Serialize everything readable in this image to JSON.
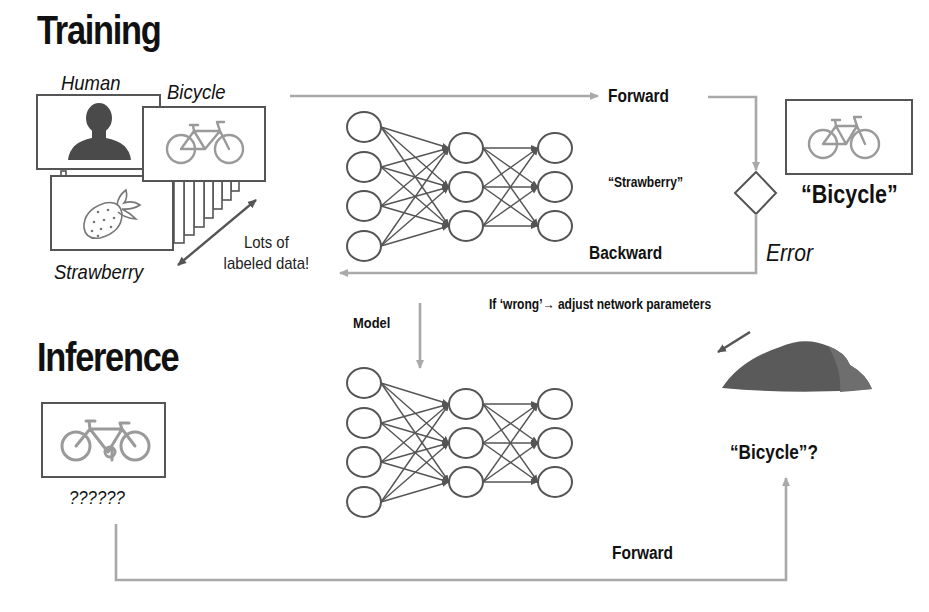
{
  "sections": {
    "training_title": "Training",
    "inference_title": "Inference"
  },
  "training": {
    "image_labels": {
      "human": "Human",
      "bicycle": "Bicycle",
      "strawberry": "Strawberry"
    },
    "dataset_note_line1": "Lots of",
    "dataset_note_line2": "labeled data!",
    "forward_label": "Forward",
    "backward_label": "Backward",
    "prediction_label": "“Strawberry”",
    "ground_truth_label": "“Bicycle”",
    "error_label": "Error",
    "adjust_note": "If ‘wrong’→ adjust network parameters",
    "network": {
      "layers": [
        4,
        3,
        3
      ]
    }
  },
  "model_label": "Model",
  "inference": {
    "unknown_label": "??????",
    "forward_label": "Forward",
    "result_label": "“Bicycle”?",
    "network": {
      "layers": [
        4,
        3,
        3
      ]
    }
  },
  "icons": {
    "human": "human-silhouette-icon",
    "bicycle": "bicycle-icon",
    "strawberry": "strawberry-icon",
    "decision": "diamond-decision-icon",
    "loss_surface": "loss-hill-icon"
  },
  "colors": {
    "text": "#111111",
    "arrow": "#a9a9a9",
    "node": "#555555",
    "icon_gray": "#9a9a9a",
    "silhouette": "#4a4a4a",
    "hill": "#5a5a5a"
  }
}
